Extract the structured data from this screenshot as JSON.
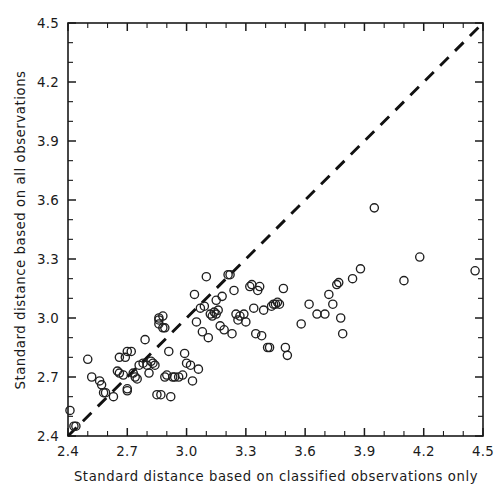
{
  "chart_data": {
    "type": "scatter",
    "title": "",
    "xlabel": "Standard distance based on classified observations only",
    "ylabel": "Standard distance based on all observations",
    "xlim": [
      2.4,
      4.5
    ],
    "ylim": [
      2.4,
      4.5
    ],
    "xticks": [
      "2.4",
      "2.7",
      "3.0",
      "3.3",
      "3.6",
      "3.9",
      "4.2",
      "4.5"
    ],
    "yticks": [
      "2.4",
      "2.7",
      "3.0",
      "3.3",
      "3.6",
      "3.9",
      "4.2",
      "4.5"
    ],
    "xtick_values": [
      2.4,
      2.7,
      3.0,
      3.3,
      3.6,
      3.9,
      4.2,
      4.5
    ],
    "ytick_values": [
      2.4,
      2.7,
      3.0,
      3.3,
      3.6,
      3.9,
      4.2,
      4.5
    ],
    "minor_tick_step": 0.1,
    "grid": false,
    "legend": "none",
    "marker": "open-circle",
    "marker_color": "#1f1f1f",
    "reference_line": {
      "name": "identity-line",
      "style": "dashed",
      "color": "#111111",
      "from": [
        2.4,
        2.4
      ],
      "to": [
        4.5,
        4.5
      ],
      "equation": "y = x"
    },
    "n_points": 118,
    "points": [
      [
        2.41,
        2.53
      ],
      [
        2.43,
        2.45
      ],
      [
        2.44,
        2.45
      ],
      [
        2.5,
        2.79
      ],
      [
        2.52,
        2.7
      ],
      [
        2.56,
        2.68
      ],
      [
        2.57,
        2.66
      ],
      [
        2.58,
        2.62
      ],
      [
        2.59,
        2.62
      ],
      [
        2.63,
        2.6
      ],
      [
        2.65,
        2.73
      ],
      [
        2.66,
        2.72
      ],
      [
        2.66,
        2.8
      ],
      [
        2.68,
        2.71
      ],
      [
        2.69,
        2.8
      ],
      [
        2.7,
        2.83
      ],
      [
        2.7,
        2.64
      ],
      [
        2.7,
        2.63
      ],
      [
        2.72,
        2.83
      ],
      [
        2.73,
        2.72
      ],
      [
        2.74,
        2.7
      ],
      [
        2.75,
        2.69
      ],
      [
        2.76,
        2.76
      ],
      [
        2.78,
        2.77
      ],
      [
        2.79,
        2.89
      ],
      [
        2.8,
        2.76
      ],
      [
        2.81,
        2.72
      ],
      [
        2.82,
        2.78
      ],
      [
        2.83,
        2.77
      ],
      [
        2.84,
        2.76
      ],
      [
        2.85,
        2.61
      ],
      [
        2.86,
        3.0
      ],
      [
        2.86,
        2.97
      ],
      [
        2.86,
        2.99
      ],
      [
        2.87,
        2.61
      ],
      [
        2.88,
        3.01
      ],
      [
        2.88,
        2.95
      ],
      [
        2.89,
        2.95
      ],
      [
        2.89,
        2.7
      ],
      [
        2.9,
        2.71
      ],
      [
        2.91,
        2.83
      ],
      [
        2.92,
        2.6
      ],
      [
        2.93,
        2.7
      ],
      [
        2.94,
        2.7
      ],
      [
        2.96,
        2.7
      ],
      [
        2.98,
        2.71
      ],
      [
        2.99,
        2.82
      ],
      [
        3.0,
        2.77
      ],
      [
        3.02,
        2.76
      ],
      [
        3.03,
        2.68
      ],
      [
        3.04,
        3.12
      ],
      [
        3.05,
        2.98
      ],
      [
        3.06,
        2.74
      ],
      [
        3.07,
        3.05
      ],
      [
        3.08,
        2.93
      ],
      [
        3.09,
        3.06
      ],
      [
        3.1,
        3.21
      ],
      [
        3.11,
        2.9
      ],
      [
        3.12,
        3.02
      ],
      [
        3.13,
        3.01
      ],
      [
        3.14,
        3.03
      ],
      [
        3.15,
        3.02
      ],
      [
        3.15,
        3.09
      ],
      [
        3.16,
        3.04
      ],
      [
        3.17,
        2.96
      ],
      [
        3.18,
        3.11
      ],
      [
        3.19,
        2.94
      ],
      [
        3.21,
        3.22
      ],
      [
        3.22,
        3.22
      ],
      [
        3.23,
        2.92
      ],
      [
        3.24,
        3.14
      ],
      [
        3.25,
        3.02
      ],
      [
        3.26,
        2.99
      ],
      [
        3.27,
        3.01
      ],
      [
        3.29,
        3.02
      ],
      [
        3.3,
        2.98
      ],
      [
        3.32,
        3.16
      ],
      [
        3.33,
        3.17
      ],
      [
        3.34,
        3.05
      ],
      [
        3.35,
        2.92
      ],
      [
        3.36,
        3.14
      ],
      [
        3.37,
        3.16
      ],
      [
        3.38,
        2.91
      ],
      [
        3.39,
        3.04
      ],
      [
        3.41,
        2.85
      ],
      [
        3.42,
        2.85
      ],
      [
        3.43,
        3.06
      ],
      [
        3.44,
        3.07
      ],
      [
        3.45,
        3.07
      ],
      [
        3.46,
        3.08
      ],
      [
        3.47,
        3.07
      ],
      [
        3.49,
        3.15
      ],
      [
        3.5,
        2.85
      ],
      [
        3.51,
        2.81
      ],
      [
        3.58,
        2.97
      ],
      [
        3.62,
        3.07
      ],
      [
        3.66,
        3.02
      ],
      [
        3.7,
        3.02
      ],
      [
        3.72,
        3.12
      ],
      [
        3.74,
        3.07
      ],
      [
        3.76,
        3.17
      ],
      [
        3.77,
        3.18
      ],
      [
        3.78,
        3.0
      ],
      [
        3.79,
        2.92
      ],
      [
        3.84,
        3.2
      ],
      [
        3.88,
        3.25
      ],
      [
        3.95,
        3.56
      ],
      [
        4.1,
        3.19
      ],
      [
        4.18,
        3.31
      ],
      [
        4.46,
        3.24
      ]
    ]
  },
  "axes": {
    "x_axis_name": "x-axis",
    "y_axis_name": "y-axis"
  }
}
